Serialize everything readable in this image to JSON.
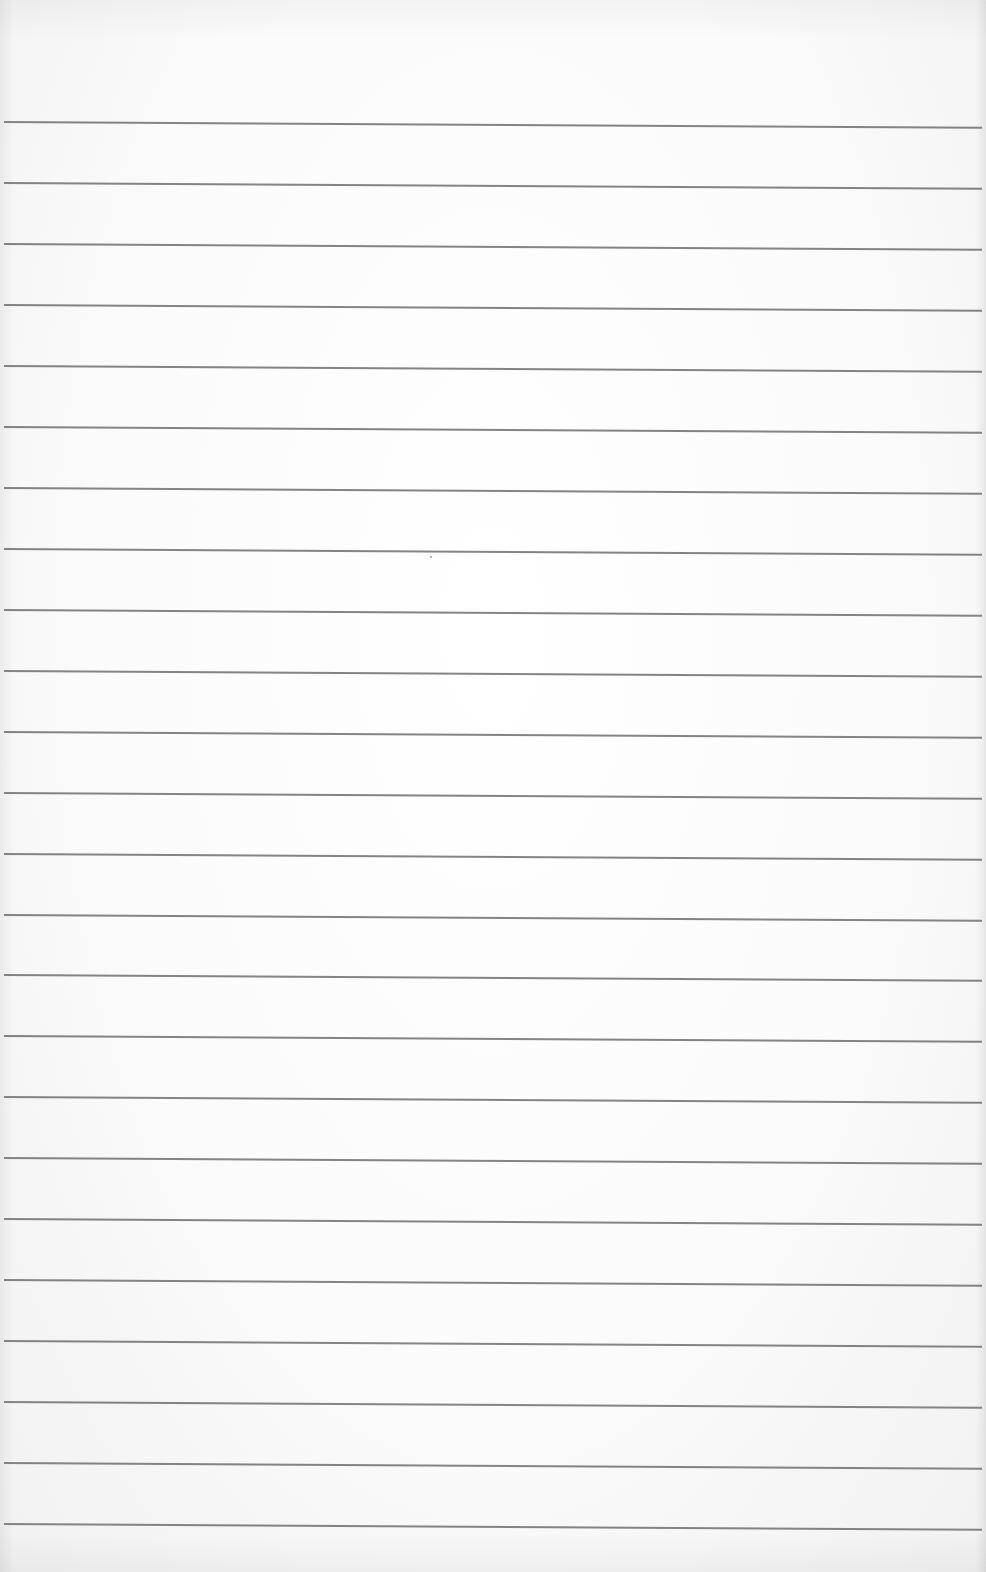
{
  "paper": {
    "type": "ruled-notepaper",
    "background_color": "#fbfbfb",
    "line_color": "#6f6f6f",
    "line_count": 24,
    "first_line_y": 121,
    "line_spacing": 60.96,
    "content_text": ""
  }
}
